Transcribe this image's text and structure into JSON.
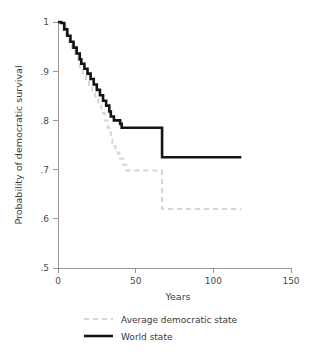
{
  "chart_data": {
    "type": "line",
    "title": "",
    "subtitle": "",
    "xlabel": "Years",
    "ylabel": "Probability of democratic survival",
    "xlim": [
      0,
      150
    ],
    "ylim": [
      0.5,
      1.0
    ],
    "xticks": [
      0,
      50,
      100,
      150
    ],
    "xtick_labels": [
      "0",
      "50",
      "100",
      "150"
    ],
    "yticks": [
      0.5,
      0.6,
      0.7,
      0.8,
      0.9,
      1.0
    ],
    "ytick_labels": [
      ".5",
      ".6",
      ".7",
      ".8",
      ".9",
      "1"
    ],
    "grid": false,
    "legend_position": "bottom",
    "step_style": "post",
    "series": [
      {
        "name": "Average democratic state",
        "color": "#d5d5d5",
        "style": "dashed",
        "x": [
          0,
          2,
          5,
          7,
          9,
          11,
          13,
          14,
          16,
          18,
          20,
          22,
          24,
          26,
          28,
          30,
          32,
          34,
          35,
          37,
          39,
          40,
          42,
          44,
          65,
          67,
          118
        ],
        "y": [
          1.0,
          0.995,
          0.975,
          0.96,
          0.945,
          0.93,
          0.915,
          0.905,
          0.893,
          0.88,
          0.868,
          0.856,
          0.843,
          0.83,
          0.815,
          0.8,
          0.785,
          0.765,
          0.748,
          0.735,
          0.732,
          0.722,
          0.71,
          0.698,
          0.698,
          0.62,
          0.62
        ]
      },
      {
        "name": "World state",
        "color": "#141414",
        "style": "solid",
        "x": [
          0,
          2,
          4,
          6,
          8,
          10,
          12,
          14,
          15,
          17,
          19,
          21,
          23,
          25,
          27,
          29,
          31,
          33,
          34,
          36,
          38,
          40,
          41,
          43,
          65,
          67,
          118
        ],
        "y": [
          1.0,
          0.998,
          0.985,
          0.972,
          0.96,
          0.948,
          0.936,
          0.924,
          0.915,
          0.905,
          0.895,
          0.884,
          0.873,
          0.862,
          0.851,
          0.84,
          0.83,
          0.818,
          0.808,
          0.8,
          0.8,
          0.793,
          0.785,
          0.785,
          0.785,
          0.725,
          0.725
        ]
      }
    ],
    "legend": [
      {
        "label": "Average democratic state",
        "color": "#d5d5d5",
        "style": "dashed"
      },
      {
        "label": "World state",
        "color": "#141414",
        "style": "solid"
      }
    ],
    "colors": {
      "axis": "#8c8c8c",
      "text": "#3a3a3a",
      "background": "#ffffff",
      "world_state": "#141414",
      "average_democratic_state": "#d5d5d5"
    }
  }
}
